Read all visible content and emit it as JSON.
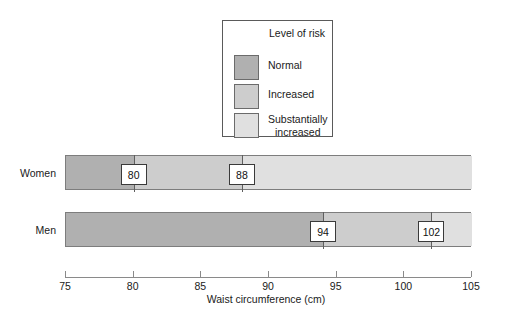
{
  "chart_data": {
    "type": "bar",
    "title": "",
    "xlabel": "Waist circumference (cm)",
    "ylabel": "",
    "xlim": [
      75,
      105
    ],
    "xticks": [
      75,
      80,
      85,
      90,
      95,
      100,
      105
    ],
    "grid": false,
    "orientation": "horizontal",
    "legend_position": "top-center",
    "categories": [
      "Women",
      "Men"
    ],
    "risk_levels": [
      {
        "key": "normal",
        "label": "Normal",
        "color": "#b0b0b0"
      },
      {
        "key": "increased",
        "label": "Increased",
        "color": "#cdcdcd"
      },
      {
        "key": "substantially_increased",
        "label": "Substantially increased",
        "color": "#e0e0e0"
      }
    ],
    "series": [
      {
        "name": "Women",
        "thresholds": [
          80,
          88
        ],
        "segments": [
          {
            "level": "normal",
            "from": 75,
            "to": 80
          },
          {
            "level": "increased",
            "from": 80,
            "to": 88
          },
          {
            "level": "substantially_increased",
            "from": 88,
            "to": 105
          }
        ]
      },
      {
        "name": "Men",
        "thresholds": [
          94,
          102
        ],
        "segments": [
          {
            "level": "normal",
            "from": 75,
            "to": 94
          },
          {
            "level": "increased",
            "from": 94,
            "to": 102
          },
          {
            "level": "substantially_increased",
            "from": 102,
            "to": 105
          }
        ]
      }
    ]
  },
  "legend": {
    "title": "Level of risk",
    "items": [
      {
        "label": "Normal",
        "color": "#b0b0b0"
      },
      {
        "label": "Increased",
        "color": "#cdcdcd"
      },
      {
        "label_line1": "Substantially",
        "label_line2": "increased",
        "color": "#e0e0e0"
      }
    ]
  },
  "rows": {
    "women_label": "Women",
    "men_label": "Men"
  },
  "values": {
    "women_t1": "80",
    "women_t2": "88",
    "men_t1": "94",
    "men_t2": "102"
  },
  "axis": {
    "title": "Waist circumference (cm)",
    "ticks": [
      "75",
      "80",
      "85",
      "90",
      "95",
      "100",
      "105"
    ]
  },
  "colors": {
    "normal": "#b0b0b0",
    "increased": "#cdcdcd",
    "substantially_increased": "#e0e0e0",
    "bar_border": "#7d7d7d",
    "axis": "#8a8a8a",
    "text": "#1a1a1a"
  }
}
